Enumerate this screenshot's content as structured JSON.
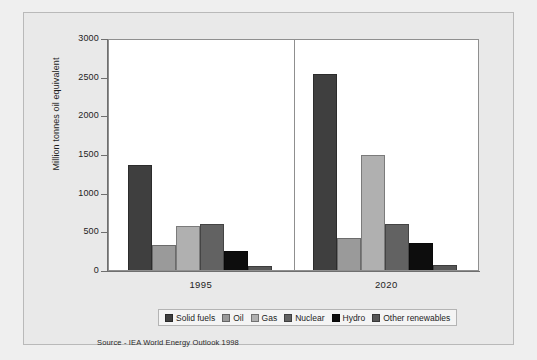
{
  "chart_data": {
    "type": "bar",
    "title": "",
    "xlabel": "",
    "ylabel": "Million tonnes oil equivalent",
    "ylim": [
      0,
      3000
    ],
    "yticks": [
      "0",
      "500",
      "1000",
      "1500",
      "2000",
      "2500",
      "3000"
    ],
    "ytick_values": [
      0,
      500,
      1000,
      1500,
      2000,
      2500,
      3000
    ],
    "grid": false,
    "legend_position": "bottom",
    "categories": [
      "1995",
      "2020"
    ],
    "series": [
      {
        "name": "Solid fuels",
        "color": "#3f3f3f",
        "values": [
          1360,
          2530
        ]
      },
      {
        "name": "Oil",
        "color": "#9a9a9a",
        "values": [
          320,
          420
        ]
      },
      {
        "name": "Gas",
        "color": "#b0b0b0",
        "values": [
          570,
          1490
        ]
      },
      {
        "name": "Nuclear",
        "color": "#626262",
        "values": [
          600,
          600
        ]
      },
      {
        "name": "Hydro",
        "color": "#0d0d0d",
        "values": [
          240,
          350
        ]
      },
      {
        "name": "Other renewables",
        "color": "#565656",
        "values": [
          50,
          60
        ]
      }
    ],
    "source": "Source - IEA World Energy Outlook 1998"
  },
  "legend": {
    "items": [
      {
        "label": "Solid fuels"
      },
      {
        "label": "Oil"
      },
      {
        "label": "Gas"
      },
      {
        "label": "Nuclear"
      },
      {
        "label": "Hydro"
      },
      {
        "label": "Other renewables"
      }
    ]
  }
}
